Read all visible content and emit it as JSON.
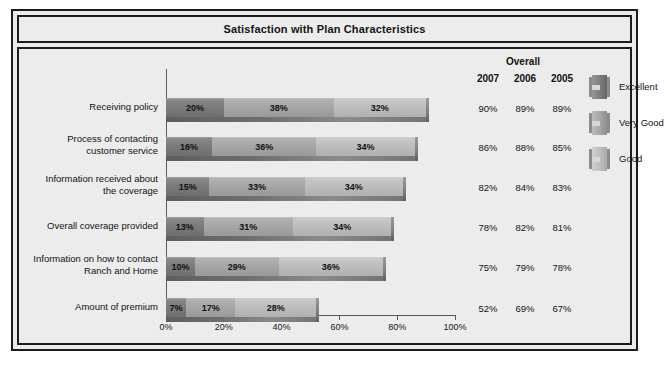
{
  "chart": {
    "title": "Satisfaction with Plan Characteristics"
  },
  "overall": {
    "group_label": "Overall",
    "years": [
      "2007",
      "2006",
      "2005"
    ]
  },
  "legend": {
    "items": [
      {
        "label": "Excellent",
        "icon": "legend-swatch-excellent",
        "color": "#7c7c7c"
      },
      {
        "label": "Very Good",
        "icon": "legend-swatch-very-good",
        "color": "#a6a6a6"
      },
      {
        "label": "Good",
        "icon": "legend-swatch-good",
        "color": "#bdbdbd"
      }
    ]
  },
  "axis": {
    "ticks": [
      "0%",
      "20%",
      "40%",
      "60%",
      "80%",
      "100%"
    ]
  },
  "rows": [
    {
      "label_line1": "Receiving policy",
      "label_line2": "",
      "excellent": "20%",
      "very_good": "38%",
      "good": "32%",
      "y2007": "90%",
      "y2006": "89%",
      "y2005": "89%"
    },
    {
      "label_line1": "Process of contacting",
      "label_line2": "customer service",
      "excellent": "16%",
      "very_good": "36%",
      "good": "34%",
      "y2007": "86%",
      "y2006": "88%",
      "y2005": "85%"
    },
    {
      "label_line1": "Information received about",
      "label_line2": "the coverage",
      "excellent": "15%",
      "very_good": "33%",
      "good": "34%",
      "y2007": "82%",
      "y2006": "84%",
      "y2005": "83%"
    },
    {
      "label_line1": "Overall coverage provided",
      "label_line2": "",
      "excellent": "13%",
      "very_good": "31%",
      "good": "34%",
      "y2007": "78%",
      "y2006": "82%",
      "y2005": "81%"
    },
    {
      "label_line1": "Information on how to contact",
      "label_line2": "Ranch and Home",
      "excellent": "10%",
      "very_good": "29%",
      "good": "36%",
      "y2007": "75%",
      "y2006": "79%",
      "y2005": "78%"
    },
    {
      "label_line1": "Amount of premium",
      "label_line2": "",
      "excellent": "7%",
      "very_good": "17%",
      "good": "28%",
      "y2007": "52%",
      "y2006": "69%",
      "y2005": "67%"
    }
  ],
  "chart_data": {
    "type": "bar",
    "orientation": "horizontal",
    "stacked": true,
    "title": "Satisfaction with Plan Characteristics",
    "xlabel": "",
    "ylabel": "",
    "xlim": [
      0,
      100
    ],
    "xticks": [
      0,
      20,
      40,
      60,
      80,
      100
    ],
    "xtick_labels": [
      "0%",
      "20%",
      "40%",
      "60%",
      "80%",
      "100%"
    ],
    "grid": false,
    "legend_position": "right",
    "categories": [
      "Receiving policy",
      "Process of contacting customer service",
      "Information received about the coverage",
      "Overall coverage provided",
      "Information on how to contact Ranch and Home",
      "Amount of premium"
    ],
    "series": [
      {
        "name": "Excellent",
        "values": [
          20,
          16,
          15,
          13,
          10,
          7
        ],
        "color": "#7c7c7c"
      },
      {
        "name": "Very Good",
        "values": [
          38,
          36,
          33,
          31,
          29,
          17
        ],
        "color": "#a6a6a6"
      },
      {
        "name": "Good",
        "values": [
          32,
          34,
          34,
          34,
          36,
          28
        ],
        "color": "#bdbdbd"
      }
    ],
    "annotations": {
      "overall_table": {
        "group_label": "Overall",
        "columns": [
          "2007",
          "2006",
          "2005"
        ],
        "rows": [
          [
            "90%",
            "89%",
            "89%"
          ],
          [
            "86%",
            "88%",
            "85%"
          ],
          [
            "82%",
            "84%",
            "83%"
          ],
          [
            "78%",
            "82%",
            "81%"
          ],
          [
            "75%",
            "79%",
            "78%"
          ],
          [
            "52%",
            "69%",
            "67%"
          ]
        ]
      }
    }
  }
}
